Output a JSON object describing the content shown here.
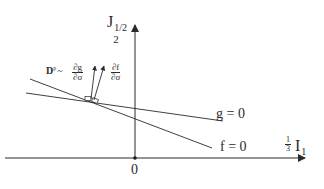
{
  "diagram": {
    "axes": {
      "vertical_label_base": "J",
      "vertical_label_sub": "2",
      "vertical_label_sup": "1/2",
      "horizontal_label_frac_num": "1",
      "horizontal_label_frac_den": "3",
      "horizontal_label_base": "I",
      "horizontal_label_sub": "1",
      "origin_label": "0"
    },
    "curves": [
      {
        "id": "g",
        "label": "g = 0"
      },
      {
        "id": "f",
        "label": "f = 0"
      }
    ],
    "annotations": {
      "plastic_strain_symbol": "D",
      "plastic_strain_sup": "p",
      "proportional": "~",
      "dg_num": "∂g",
      "dg_den": "∂σ",
      "df_num": "∂f",
      "df_den": "∂σ"
    },
    "colors": {
      "line": "#2a2a2a",
      "background": "#ffffff"
    }
  }
}
